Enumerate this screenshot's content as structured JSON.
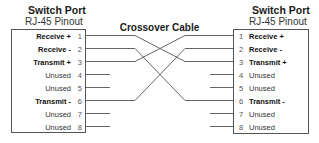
{
  "left": {
    "title": "Switch Port",
    "subtitle": "RJ-45 Pinout",
    "pins": [
      {
        "num": "1",
        "label": "Receive +",
        "bold": true
      },
      {
        "num": "2",
        "label": "Receive -",
        "bold": true
      },
      {
        "num": "3",
        "label": "Transmit +",
        "bold": true
      },
      {
        "num": "4",
        "label": "Unused",
        "bold": false
      },
      {
        "num": "5",
        "label": "Unused",
        "bold": false
      },
      {
        "num": "6",
        "label": "Transmit -",
        "bold": true
      },
      {
        "num": "7",
        "label": "Unused",
        "bold": false
      },
      {
        "num": "8",
        "label": "Unused",
        "bold": false
      }
    ]
  },
  "right": {
    "title": "Switch Port",
    "subtitle": "RJ-45 Pinout",
    "pins": [
      {
        "num": "1",
        "label": "Receive +",
        "bold": true
      },
      {
        "num": "2",
        "label": "Receive -",
        "bold": true
      },
      {
        "num": "3",
        "label": "Transmit +",
        "bold": true
      },
      {
        "num": "4",
        "label": "Unused",
        "bold": false
      },
      {
        "num": "5",
        "label": "Unused",
        "bold": false
      },
      {
        "num": "6",
        "label": "Transmit -",
        "bold": true
      },
      {
        "num": "7",
        "label": "Unused",
        "bold": false
      },
      {
        "num": "8",
        "label": "Unused",
        "bold": false
      }
    ]
  },
  "cable": {
    "title": "Crossover Cable",
    "connections": [
      {
        "from": "1",
        "to": "3"
      },
      {
        "from": "2",
        "to": "6"
      },
      {
        "from": "3",
        "to": "1"
      },
      {
        "from": "6",
        "to": "2"
      }
    ],
    "color": "#555555"
  }
}
